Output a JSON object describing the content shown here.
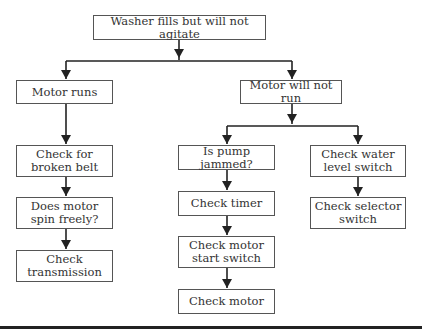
{
  "diagram": {
    "type": "flowchart",
    "title": "Washer fills but will not agitate",
    "nodes": {
      "root": "Washer fills but will not agitate",
      "motor_runs": "Motor runs",
      "motor_not_run": "Motor will not run",
      "broken_belt": "Check for\nbroken belt",
      "spin_freely": "Does motor\nspin freely?",
      "transmission": "Check\ntransmission",
      "pump_jammed": "Is pump jammed?",
      "timer": "Check timer",
      "start_switch": "Check motor\nstart switch",
      "check_motor": "Check motor",
      "water_level": "Check water\nlevel switch",
      "selector": "Check selector\nswitch"
    },
    "edges": [
      [
        "root",
        "motor_runs"
      ],
      [
        "root",
        "motor_not_run"
      ],
      [
        "motor_runs",
        "broken_belt"
      ],
      [
        "broken_belt",
        "spin_freely"
      ],
      [
        "spin_freely",
        "transmission"
      ],
      [
        "motor_not_run",
        "pump_jammed"
      ],
      [
        "motor_not_run",
        "water_level"
      ],
      [
        "pump_jammed",
        "timer"
      ],
      [
        "timer",
        "start_switch"
      ],
      [
        "start_switch",
        "check_motor"
      ],
      [
        "water_level",
        "selector"
      ]
    ],
    "colors": {
      "line": "#222222",
      "border": "#555555",
      "text": "#333333"
    }
  }
}
